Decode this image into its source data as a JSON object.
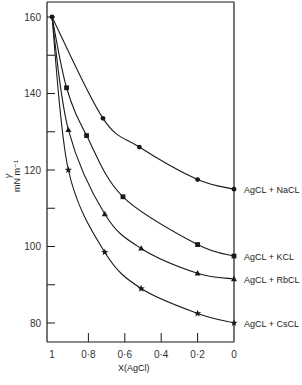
{
  "chart_data": {
    "type": "line",
    "title": "",
    "xlabel": "X(AgCl)",
    "ylabel": "γ mN m⁻¹",
    "ylabel_parts": {
      "symbol": "γ",
      "units": "mN  m⁻¹"
    },
    "xlim": [
      1,
      0
    ],
    "ylim": [
      80,
      160
    ],
    "x_ticks": [
      1,
      0.8,
      0.6,
      0.4,
      0.2,
      0
    ],
    "x_tick_labels": [
      "1",
      "0·8",
      "0·6",
      "0·4",
      "0·2",
      "0"
    ],
    "y_ticks": [
      80,
      90,
      100,
      110,
      120,
      130,
      140,
      150,
      160
    ],
    "y_tick_labels": {
      "80": "80",
      "100": "100",
      "120": "120",
      "140": "140",
      "160": "160"
    },
    "grid": false,
    "legend_position": "labels at right end of each curve",
    "series": [
      {
        "name": "AgCl + NaCl",
        "marker": "circle",
        "points": [
          [
            1,
            160
          ],
          [
            0.72,
            133.5
          ],
          [
            0.52,
            126
          ],
          [
            0.2,
            117.5
          ],
          [
            0,
            115
          ]
        ]
      },
      {
        "name": "AgCl + KCl",
        "marker": "square",
        "points": [
          [
            1,
            160
          ],
          [
            0.92,
            141.5
          ],
          [
            0.81,
            129
          ],
          [
            0.61,
            113
          ],
          [
            0.2,
            100.5
          ],
          [
            0,
            97.5
          ]
        ]
      },
      {
        "name": "AgCl + RbCl",
        "marker": "triangle",
        "points": [
          [
            1,
            160
          ],
          [
            0.91,
            130.5
          ],
          [
            0.71,
            108.5
          ],
          [
            0.51,
            99.5
          ],
          [
            0.2,
            93
          ],
          [
            0,
            91.5
          ]
        ]
      },
      {
        "name": "AgCl + CsCl",
        "marker": "star",
        "points": [
          [
            1,
            160
          ],
          [
            0.91,
            120
          ],
          [
            0.71,
            98.5
          ],
          [
            0.51,
            89
          ],
          [
            0.2,
            82.5
          ],
          [
            0,
            80
          ]
        ]
      }
    ]
  },
  "labels": {
    "x_axis_title": "X(AgCl)",
    "y_axis_symbol": "γ",
    "y_axis_units": "mN  m⁻¹",
    "series": [
      "AgCL + NaCL",
      "AgCL + KCL",
      "AgCL + RbCL",
      "AgCL + CsCL"
    ]
  }
}
